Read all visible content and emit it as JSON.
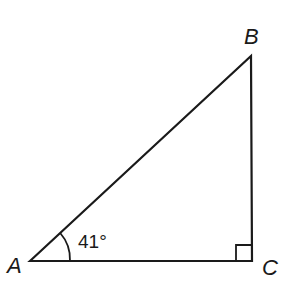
{
  "figure": {
    "type": "right-triangle",
    "vertices": {
      "A": {
        "label": "A"
      },
      "B": {
        "label": "B"
      },
      "C": {
        "label": "C"
      }
    },
    "right_angle_at": "C",
    "angle_A": {
      "value": 41,
      "unit": "degrees",
      "label": "41°"
    },
    "colors": {
      "stroke": "#1a1a1a",
      "background": "#ffffff"
    }
  }
}
